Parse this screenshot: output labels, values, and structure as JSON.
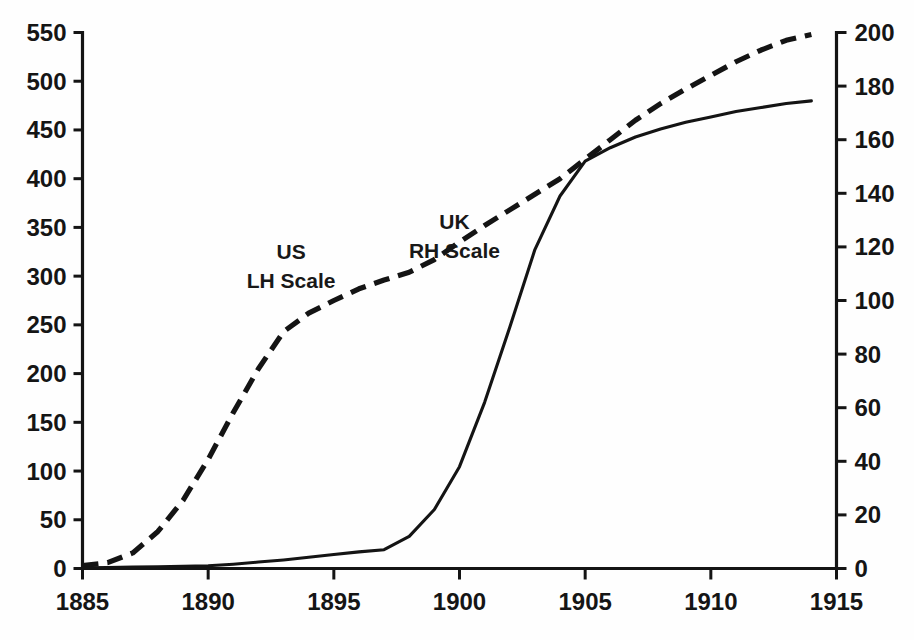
{
  "chart_data": {
    "type": "line",
    "title": "",
    "subtitle": "",
    "xlabel": "",
    "ylabel": "",
    "grid": false,
    "legend_position": "inline-annotation",
    "xlim": [
      1885,
      1915
    ],
    "x_ticks": [
      1885,
      1890,
      1895,
      1900,
      1905,
      1910,
      1915
    ],
    "x_tick_labels": [
      "1885",
      "1890",
      "1895",
      "1900",
      "1905",
      "1910",
      "1915"
    ],
    "y_left": {
      "label": "",
      "lim": [
        0,
        550
      ],
      "ticks": [
        0,
        50,
        100,
        150,
        200,
        250,
        300,
        350,
        400,
        450,
        500,
        550
      ],
      "tick_labels": [
        "0",
        "50",
        "100",
        "150",
        "200",
        "250",
        "300",
        "350",
        "400",
        "450",
        "500",
        "550"
      ]
    },
    "y_right": {
      "label": "",
      "lim": [
        0,
        200
      ],
      "ticks": [
        0,
        20,
        40,
        60,
        80,
        100,
        120,
        140,
        160,
        180,
        200
      ],
      "tick_labels": [
        "0",
        "20",
        "40",
        "60",
        "80",
        "100",
        "120",
        "140",
        "160",
        "180",
        "200"
      ]
    },
    "series": [
      {
        "name": "US",
        "axis": "left",
        "style": "dashed",
        "color": "#141414",
        "annotation": [
          "US",
          "LH Scale"
        ],
        "annotation_x": 1893.3,
        "annotation_y_left": 318,
        "x": [
          1885,
          1886,
          1887,
          1888,
          1889,
          1890,
          1891,
          1892,
          1893,
          1894,
          1895,
          1896,
          1897,
          1898,
          1899,
          1900,
          1901,
          1902,
          1903,
          1904,
          1905,
          1906,
          1907,
          1908,
          1909,
          1910,
          1911,
          1912,
          1913,
          1914
        ],
        "values": [
          3,
          6,
          16,
          38,
          70,
          112,
          160,
          205,
          243,
          262,
          275,
          287,
          296,
          304,
          317,
          335,
          352,
          368,
          384,
          400,
          420,
          440,
          460,
          477,
          492,
          506,
          520,
          532,
          542,
          548
        ]
      },
      {
        "name": "UK",
        "axis": "right",
        "style": "solid",
        "color": "#141414",
        "annotation": [
          "UK",
          "RH Scale"
        ],
        "annotation_x": 1899.8,
        "annotation_y_left": 348,
        "x": [
          1885,
          1886,
          1887,
          1888,
          1889,
          1890,
          1891,
          1892,
          1893,
          1894,
          1895,
          1896,
          1897,
          1898,
          1899,
          1900,
          1901,
          1902,
          1903,
          1904,
          1905,
          1906,
          1907,
          1908,
          1909,
          1910,
          1911,
          1912,
          1913,
          1914
        ],
        "values": [
          0.3,
          0.4,
          0.5,
          0.6,
          0.8,
          1.0,
          1.6,
          2.4,
          3.2,
          4.2,
          5.2,
          6.2,
          7.0,
          12.0,
          22.0,
          38.0,
          62.0,
          90.0,
          119.0,
          139.0,
          152.0,
          157.0,
          161.0,
          164.0,
          166.5,
          168.5,
          170.5,
          172.0,
          173.5,
          174.5
        ]
      }
    ]
  }
}
